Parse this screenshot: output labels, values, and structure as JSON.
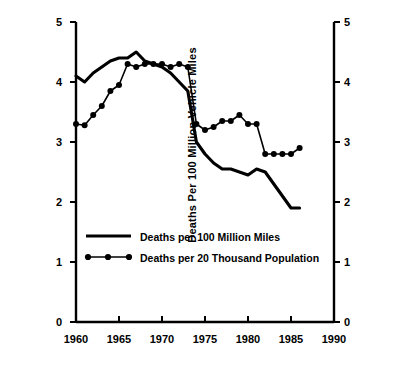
{
  "chart_data": {
    "type": "line",
    "title": "",
    "xlabel": "",
    "ylabel": "Deaths Per 100 Million Vehicle Miles",
    "ylabel_right": "Deaths Per 20,000 Population",
    "xlim": [
      1960,
      1990
    ],
    "ylim": [
      0,
      5
    ],
    "ylim_right": [
      0,
      5
    ],
    "grid": false,
    "legend_position": "inside-lower-left",
    "x_ticks": [
      "1960",
      "1965",
      "1970",
      "1975",
      "1980",
      "1985",
      "1990"
    ],
    "x_tick_values": [
      1960,
      1965,
      1970,
      1975,
      1980,
      1985,
      1990
    ],
    "y_ticks": [
      "0",
      "1",
      "2",
      "3",
      "4",
      "5"
    ],
    "y_tick_values": [
      0,
      1,
      2,
      3,
      4,
      5
    ],
    "y_ticks_right": [
      "0",
      "1",
      "2",
      "3",
      "4",
      "5"
    ],
    "x": [
      1960,
      1961,
      1962,
      1963,
      1964,
      1965,
      1966,
      1967,
      1968,
      1969,
      1970,
      1971,
      1972,
      1973,
      1974,
      1975,
      1976,
      1977,
      1978,
      1979,
      1980,
      1981,
      1982,
      1983,
      1984,
      1985,
      1986
    ],
    "series": [
      {
        "name": "Deaths per 100 Million Miles",
        "style": "solid-line",
        "marker": "none",
        "color": "#000000",
        "values": [
          4.1,
          4.0,
          4.15,
          4.25,
          4.35,
          4.4,
          4.4,
          4.5,
          4.35,
          4.3,
          4.25,
          4.15,
          4.0,
          3.85,
          3.0,
          2.8,
          2.65,
          2.55,
          2.55,
          2.5,
          2.45,
          2.55,
          2.5,
          2.3,
          2.1,
          1.9,
          1.9
        ]
      },
      {
        "name": "Deaths per 20 Thousand Population",
        "style": "line-with-dot-markers",
        "marker": "filled-circle",
        "color": "#000000",
        "values": [
          3.3,
          3.28,
          3.45,
          3.6,
          3.85,
          3.95,
          4.3,
          4.25,
          4.3,
          4.3,
          4.3,
          4.25,
          4.3,
          4.25,
          3.3,
          3.2,
          3.25,
          3.35,
          3.35,
          3.45,
          3.3,
          3.3,
          2.8,
          2.8,
          2.8,
          2.8,
          2.9
        ]
      }
    ],
    "legend": [
      {
        "label": "Deaths per 100 Million Miles",
        "style": "solid-line"
      },
      {
        "label": "Deaths per 20 Thousand Population",
        "style": "line-with-dot-markers"
      }
    ]
  },
  "axes": {
    "left_title": "Deaths Per 100 Million Vehicle Miles",
    "right_title": "Deaths Per 20,000 Population"
  },
  "legend": {
    "item_0_label": "Deaths per 100 Million Miles",
    "item_1_label": "Deaths per 20 Thousand Population"
  },
  "ticks": {
    "y0": "0",
    "y1": "1",
    "y2": "2",
    "y3": "3",
    "y4": "4",
    "y5": "5",
    "r0": "0",
    "r1": "1",
    "r2": "2",
    "r3": "3",
    "r4": "4",
    "r5": "5",
    "x0": "1960",
    "x1": "1965",
    "x2": "1970",
    "x3": "1975",
    "x4": "1980",
    "x5": "1985",
    "x6": "1990"
  }
}
